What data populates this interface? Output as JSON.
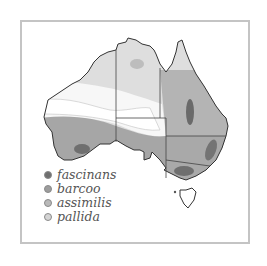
{
  "map": {
    "subject": "Australia species distribution",
    "colors": {
      "fascinans": "#7a7a7a",
      "barcoo": "#a9a9a9",
      "assimilis": "#c8c8c8",
      "pallida": "#dedede",
      "background": "#ffffff",
      "frame": "#c4c4c4"
    }
  },
  "legend": {
    "items": [
      {
        "label": "fascinans",
        "color": "#6f6f6f"
      },
      {
        "label": "barcoo",
        "color": "#9d9d9d"
      },
      {
        "label": "assimilis",
        "color": "#b9b9b9"
      },
      {
        "label": "pallida",
        "color": "#d4d4d4"
      }
    ]
  }
}
